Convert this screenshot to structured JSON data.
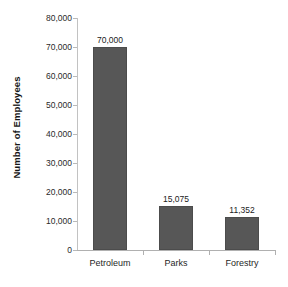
{
  "chart_data": {
    "type": "bar",
    "title": "",
    "subtitle": "",
    "xlabel": "",
    "ylabel": "Number of Employees",
    "categories": [
      "Petroleum",
      "Parks",
      "Forestry"
    ],
    "values": [
      70000,
      15075,
      11352
    ],
    "data_labels": [
      "70,000",
      "15,075",
      "11,352"
    ],
    "ylim": [
      0,
      80000
    ],
    "y_ticks": [
      0,
      10000,
      20000,
      30000,
      40000,
      50000,
      60000,
      70000,
      80000
    ],
    "y_tick_labels": [
      "0",
      "10,000",
      "20,000",
      "30,000",
      "40,000",
      "50,000",
      "60,000",
      "70,000",
      "80,000"
    ],
    "grid": false,
    "legend": false,
    "legend_position": "none",
    "bar_color": "#575757",
    "bar_border_color": "#4c4c4c",
    "axis_color": "#b0b0b0",
    "text_color": "#1f1f1f",
    "background_color": "#ffffff"
  }
}
